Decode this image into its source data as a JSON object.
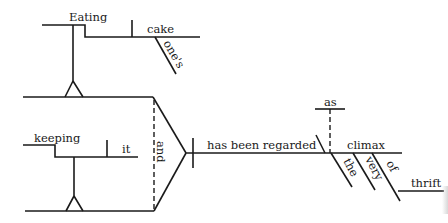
{
  "diagram": {
    "type": "sentence-diagram",
    "words": {
      "eating": "Eating",
      "cake": "cake",
      "ones": "one's",
      "keeping": "keeping",
      "it": "it",
      "and": "and",
      "predicate": "has been regarded",
      "as": "as",
      "climax": "climax",
      "the": "the",
      "very": "very",
      "of": "of",
      "thrift": "thrift"
    },
    "colors": {
      "ink": "#1a1a1a",
      "background": "#ffffff"
    }
  }
}
